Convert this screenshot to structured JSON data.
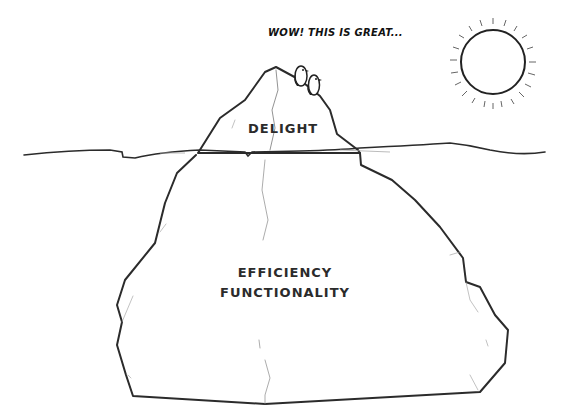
{
  "diagram": {
    "type": "iceberg",
    "speech_bubble": "WOW! THIS IS GREAT...",
    "above_water": {
      "label": "DELIGHT"
    },
    "below_water": {
      "labels": [
        "EFFICIENCY",
        "FUNCTIONALITY"
      ]
    },
    "elements": [
      "sun",
      "two-penguins",
      "waterline",
      "iceberg-tip",
      "iceberg-base"
    ],
    "colors": {
      "stroke": "#2b2b2b",
      "background": "#ffffff",
      "text": "#2b2b2b"
    }
  }
}
